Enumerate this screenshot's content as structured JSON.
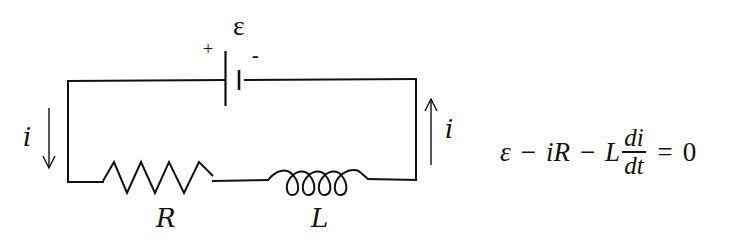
{
  "diagram": {
    "type": "RL circuit",
    "colors": {
      "stroke": "#111111",
      "background": "#ffffff"
    },
    "battery": {
      "symbol": "ε",
      "positive_label": "+",
      "negative_label": "-"
    },
    "resistor": {
      "label": "R"
    },
    "inductor": {
      "label": "L"
    },
    "current_left": {
      "label": "i",
      "direction": "down"
    },
    "current_right": {
      "label": "i",
      "direction": "up"
    }
  },
  "equation": {
    "emf": "ε",
    "minus1": "−",
    "term1": "iR",
    "minus2": "−",
    "coef": "L",
    "frac_num": "di",
    "frac_den": "dt",
    "equals": "=",
    "rhs": "0"
  }
}
